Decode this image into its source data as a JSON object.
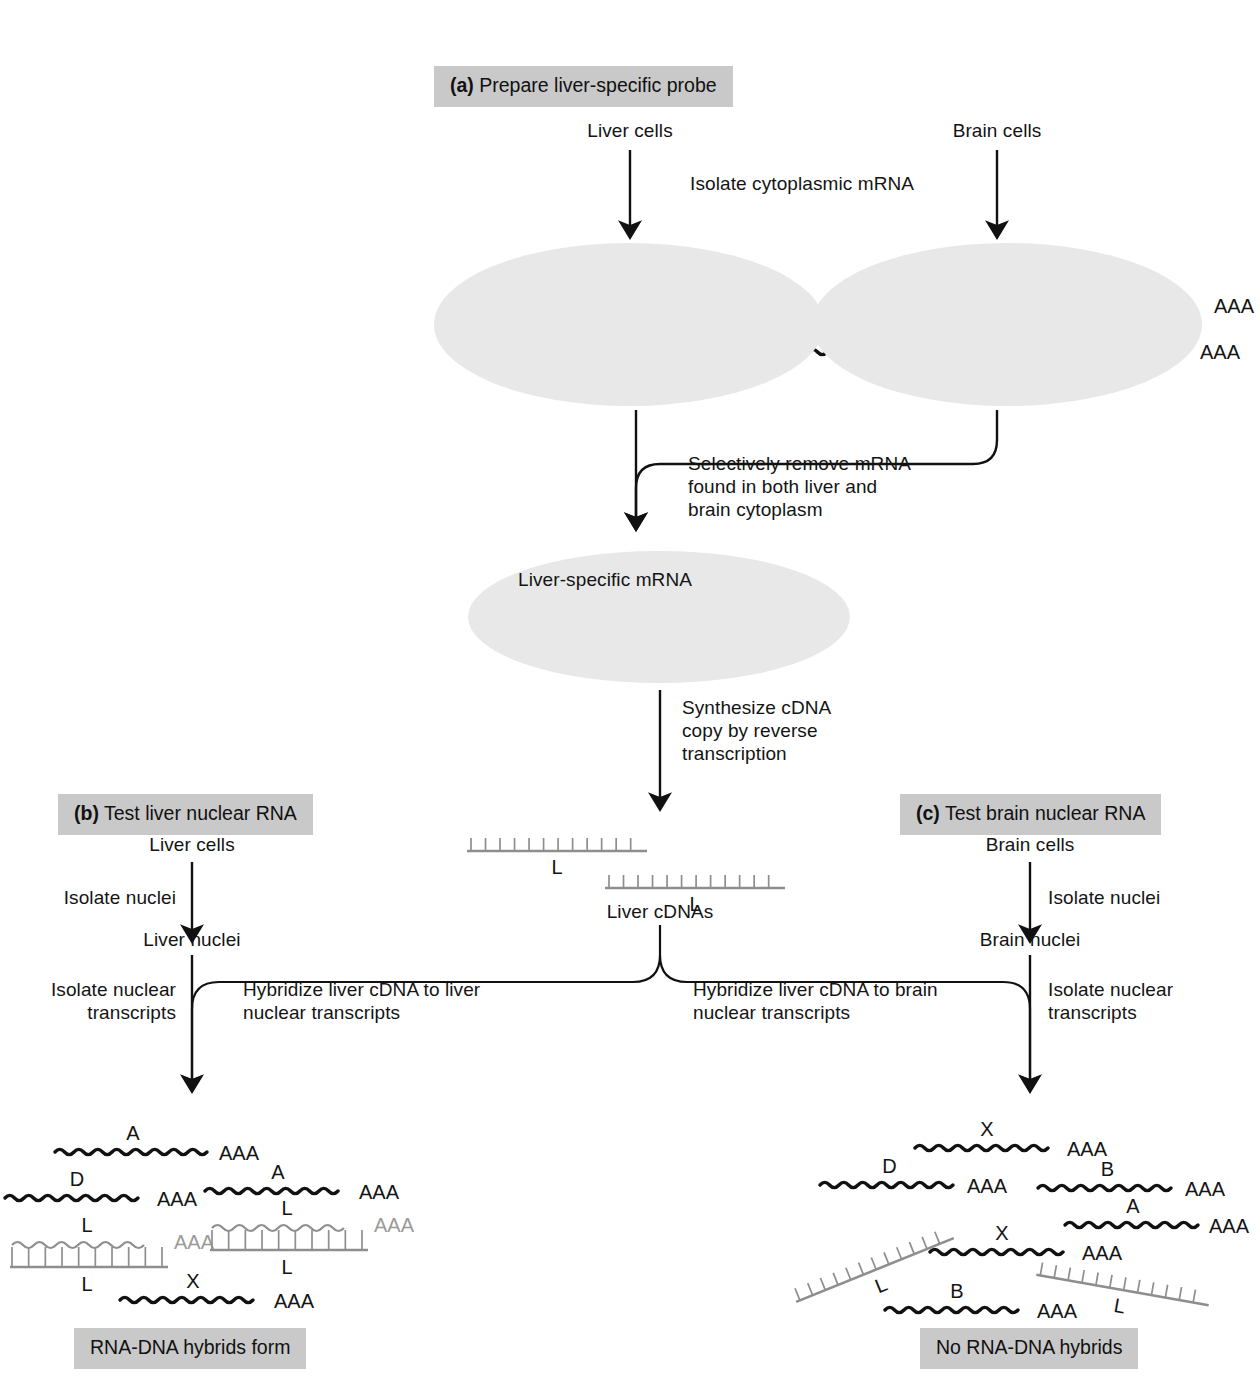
{
  "figure": {
    "title_a": "(a) Prepare liver-specific probe",
    "title_a_tag": "(a)",
    "title_a_text": "Prepare liver-specific probe",
    "title_b_tag": "(b)",
    "title_b_text": "Test liver nuclear RNA",
    "title_c_tag": "(c)",
    "title_c_text": "Test brain nuclear RNA"
  },
  "panel_a": {
    "liver_cells_label": "Liver cells",
    "brain_cells_label": "Brain cells",
    "isolate_mrna_label": "Isolate cytoplasmic mRNA",
    "remove_label": "Selectively remove mRNA\nfound in both liver and\nbrain cytoplasm",
    "liver_specific_label": "Liver-specific mRNA",
    "synthesize_label": "Synthesize cDNA\ncopy by reverse\ntranscription",
    "liver_cdnas_label": "Liver cDNAs",
    "liver_cytoplasm_strands": [
      {
        "letter": "A",
        "tail": "AAA",
        "color": "black"
      },
      {
        "letter": "L",
        "tail": "AAA",
        "color": "gray"
      },
      {
        "letter": "D",
        "tail": "AAA",
        "color": "black"
      },
      {
        "letter": "X",
        "tail": "AAA",
        "color": "black"
      },
      {
        "letter": "L",
        "tail": "AAA",
        "color": "gray"
      }
    ],
    "brain_cytoplasm_strands": [
      {
        "letter": "X",
        "tail": "AAA",
        "color": "black"
      },
      {
        "letter": "B",
        "tail": "AAA",
        "color": "black"
      },
      {
        "letter": "D",
        "tail": "AAA",
        "color": "black"
      },
      {
        "letter": "A",
        "tail": "AAA",
        "color": "black"
      },
      {
        "letter": "X",
        "tail": "AAA",
        "color": "black"
      }
    ],
    "liver_specific_strands": [
      {
        "letter": "L",
        "tail": "AAA",
        "color": "gray"
      },
      {
        "letter": "L",
        "tail": "AAA",
        "color": "gray"
      }
    ],
    "cdna_probes": [
      {
        "letter": "L"
      },
      {
        "letter": "L"
      }
    ]
  },
  "panel_b": {
    "cells_label": "Liver cells",
    "isolate_nuclei_label": "Isolate nuclei",
    "nuclei_label": "Liver nuclei",
    "isolate_transcripts_label": "Isolate nuclear\ntranscripts",
    "hybridize_label": "Hybridize liver cDNA to liver\nnuclear transcripts",
    "result_label": "RNA-DNA hybrids form",
    "transcripts": [
      {
        "letter": "A",
        "tail": "AAA",
        "kind": "rna",
        "color": "black"
      },
      {
        "letter": "A",
        "tail": "AAA",
        "kind": "rna",
        "color": "black"
      },
      {
        "letter": "D",
        "tail": "AAA",
        "kind": "rna",
        "color": "black"
      },
      {
        "letter": "L",
        "tail": "AAA",
        "kind": "hybrid",
        "color": "gray",
        "lower_letter": "L"
      },
      {
        "letter": "L",
        "tail": "AAA",
        "kind": "hybrid",
        "color": "gray",
        "lower_letter": "L"
      },
      {
        "letter": "X",
        "tail": "AAA",
        "kind": "rna",
        "color": "black"
      }
    ]
  },
  "panel_c": {
    "cells_label": "Brain cells",
    "isolate_nuclei_label": "Isolate nuclei",
    "nuclei_label": "Brain nuclei",
    "isolate_transcripts_label": "Isolate nuclear\ntranscripts",
    "hybridize_label": "Hybridize liver cDNA to brain\nnuclear transcripts",
    "result_label": "No RNA-DNA hybrids",
    "transcripts": [
      {
        "letter": "X",
        "tail": "AAA",
        "kind": "rna",
        "color": "black"
      },
      {
        "letter": "D",
        "tail": "AAA",
        "kind": "rna",
        "color": "black"
      },
      {
        "letter": "B",
        "tail": "AAA",
        "kind": "rna",
        "color": "black"
      },
      {
        "letter": "A",
        "tail": "AAA",
        "kind": "rna",
        "color": "black"
      },
      {
        "letter": "X",
        "tail": "AAA",
        "kind": "rna",
        "color": "black"
      },
      {
        "letter": "B",
        "tail": "AAA",
        "kind": "rna",
        "color": "black"
      }
    ],
    "free_cdnas": [
      {
        "letter": "L"
      },
      {
        "letter": "L"
      }
    ]
  },
  "colors": {
    "shade_box": "#c9c9c9",
    "oval_fill": "#e8e8e8",
    "rna_black": "#111111",
    "rna_gray": "#8e8e8e",
    "ink": "#141414"
  }
}
